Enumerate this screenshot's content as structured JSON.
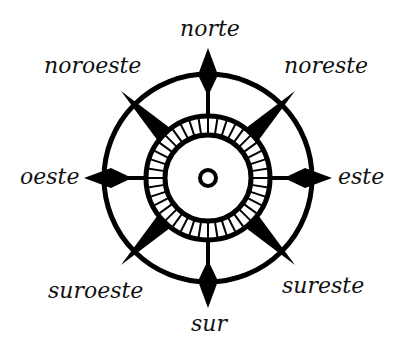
{
  "diagram": {
    "type": "compass-rose",
    "directions": {
      "n": "norte",
      "ne": "noreste",
      "e": "este",
      "se": "sureste",
      "s": "sur",
      "sw": "suroeste",
      "w": "oeste",
      "nw": "noroeste"
    },
    "colors": {
      "ink": "#000000",
      "background": "#ffffff"
    }
  }
}
